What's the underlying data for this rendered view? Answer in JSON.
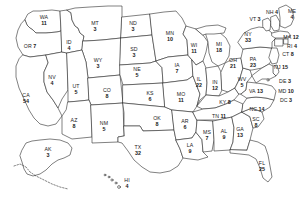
{
  "map": {
    "title": "United States Electoral College Map",
    "region_label": "United States",
    "stroke_color": "#2b2b2b",
    "fill_color": "#ffffff",
    "text_color": "#1a1a1a"
  },
  "states": [
    {
      "abbr": "WA",
      "votes": "11",
      "x": 44,
      "y": 20,
      "inline": false
    },
    {
      "abbr": "OR",
      "votes": "7",
      "x": 30,
      "y": 43,
      "inline": true
    },
    {
      "abbr": "CA",
      "votes": "54",
      "x": 26,
      "y": 98,
      "inline": false
    },
    {
      "abbr": "NV",
      "votes": "4",
      "x": 52,
      "y": 80,
      "inline": false
    },
    {
      "abbr": "ID",
      "votes": "4",
      "x": 69,
      "y": 45,
      "inline": false
    },
    {
      "abbr": "MT",
      "votes": "3",
      "x": 95,
      "y": 26,
      "inline": false
    },
    {
      "abbr": "WY",
      "votes": "3",
      "x": 98,
      "y": 63,
      "inline": false
    },
    {
      "abbr": "UT",
      "votes": "5",
      "x": 76,
      "y": 89,
      "inline": false
    },
    {
      "abbr": "AZ",
      "votes": "8",
      "x": 74,
      "y": 123,
      "inline": false
    },
    {
      "abbr": "NM",
      "votes": "5",
      "x": 104,
      "y": 126,
      "inline": false
    },
    {
      "abbr": "CO",
      "votes": "8",
      "x": 107,
      "y": 93,
      "inline": false
    },
    {
      "abbr": "ND",
      "votes": "3",
      "x": 133,
      "y": 26,
      "inline": false
    },
    {
      "abbr": "SD",
      "votes": "3",
      "x": 134,
      "y": 52,
      "inline": false
    },
    {
      "abbr": "NE",
      "votes": "5",
      "x": 137,
      "y": 72,
      "inline": false
    },
    {
      "abbr": "KS",
      "votes": "6",
      "x": 150,
      "y": 96,
      "inline": false
    },
    {
      "abbr": "OK",
      "votes": "8",
      "x": 157,
      "y": 121,
      "inline": false
    },
    {
      "abbr": "TX",
      "votes": "32",
      "x": 138,
      "y": 150,
      "inline": false
    },
    {
      "abbr": "MN",
      "votes": "10",
      "x": 170,
      "y": 36,
      "inline": false
    },
    {
      "abbr": "IA",
      "votes": "7",
      "x": 177,
      "y": 68,
      "inline": false
    },
    {
      "abbr": "MO",
      "votes": "11",
      "x": 181,
      "y": 97,
      "inline": false
    },
    {
      "abbr": "AR",
      "votes": "6",
      "x": 185,
      "y": 124,
      "inline": false
    },
    {
      "abbr": "LA",
      "votes": "9",
      "x": 190,
      "y": 148,
      "inline": false
    },
    {
      "abbr": "WI",
      "votes": "11",
      "x": 194,
      "y": 48,
      "inline": false
    },
    {
      "abbr": "IL",
      "votes": "22",
      "x": 199,
      "y": 82,
      "inline": false
    },
    {
      "abbr": "MS",
      "votes": "7",
      "x": 207,
      "y": 135,
      "inline": false
    },
    {
      "abbr": "MI",
      "votes": "18",
      "x": 219,
      "y": 47,
      "inline": false
    },
    {
      "abbr": "IN",
      "votes": "12",
      "x": 215,
      "y": 85,
      "inline": false
    },
    {
      "abbr": "KY",
      "votes": "8",
      "x": 225,
      "y": 99,
      "inline": true
    },
    {
      "abbr": "TN",
      "votes": "11",
      "x": 219,
      "y": 113,
      "inline": true
    },
    {
      "abbr": "AL",
      "votes": "9",
      "x": 224,
      "y": 134,
      "inline": false
    },
    {
      "abbr": "OH",
      "votes": "21",
      "x": 233,
      "y": 63,
      "inline": false
    },
    {
      "abbr": "WV",
      "votes": "5",
      "x": 242,
      "y": 82,
      "inline": false
    },
    {
      "abbr": "GA",
      "votes": "13",
      "x": 240,
      "y": 132,
      "inline": false
    },
    {
      "abbr": "FL",
      "votes": "25",
      "x": 262,
      "y": 166,
      "inline": false
    },
    {
      "abbr": "SC",
      "votes": "8",
      "x": 256,
      "y": 122,
      "inline": false
    },
    {
      "abbr": "NC",
      "votes": "14",
      "x": 257,
      "y": 106,
      "inline": true
    },
    {
      "abbr": "VA",
      "votes": "13",
      "x": 256,
      "y": 88,
      "inline": true
    },
    {
      "abbr": "PA",
      "votes": "23",
      "x": 253,
      "y": 62,
      "inline": false
    },
    {
      "abbr": "NY",
      "votes": "33",
      "x": 248,
      "y": 37,
      "inline": false
    },
    {
      "abbr": "VT",
      "votes": "3",
      "x": 255,
      "y": 16,
      "inline": true
    },
    {
      "abbr": "NH",
      "votes": "4",
      "x": 272,
      "y": 9,
      "inline": true
    },
    {
      "abbr": "ME",
      "votes": "4",
      "x": 292,
      "y": 14,
      "inline": false
    },
    {
      "abbr": "MA",
      "votes": "12",
      "x": 291,
      "y": 34,
      "inline": true
    },
    {
      "abbr": "RI",
      "votes": "4",
      "x": 292,
      "y": 43,
      "inline": true
    },
    {
      "abbr": "CT",
      "votes": "8",
      "x": 288,
      "y": 51,
      "inline": true
    },
    {
      "abbr": "NJ",
      "votes": "15",
      "x": 281,
      "y": 64,
      "inline": true
    },
    {
      "abbr": "DE",
      "votes": "3",
      "x": 285,
      "y": 78,
      "inline": true
    },
    {
      "abbr": "MD",
      "votes": "10",
      "x": 286,
      "y": 88,
      "inline": true
    },
    {
      "abbr": "DC",
      "votes": "3",
      "x": 286,
      "y": 97,
      "inline": true
    },
    {
      "abbr": "AK",
      "votes": "3",
      "x": 48,
      "y": 152,
      "inline": false
    },
    {
      "abbr": "HI",
      "votes": "4",
      "x": 127,
      "y": 183,
      "inline": false
    }
  ]
}
